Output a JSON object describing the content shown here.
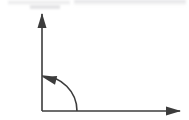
{
  "figure": {
    "kind": "line-art-diagram",
    "background_color": "#ffffff",
    "stroke_color": "#3c3c3c",
    "stroke_width": 1.6,
    "canvas": {
      "width": 189,
      "height": 120
    }
  },
  "geometry": {
    "origin": {
      "x": 42,
      "y": 111
    },
    "y_axis": {
      "name": "vertical-axis",
      "from": {
        "x": 42,
        "y": 111
      },
      "to": {
        "x": 42,
        "y": 14
      },
      "arrow_at": "end",
      "direction": "up"
    },
    "x_axis": {
      "name": "horizontal-axis",
      "from": {
        "x": 42,
        "y": 111
      },
      "to": {
        "x": 180,
        "y": 111
      },
      "arrow_at": "end",
      "direction": "right"
    },
    "arc": {
      "name": "rotation-arc",
      "center": {
        "x": 42,
        "y": 111
      },
      "radius": 35,
      "start_angle_deg": 0,
      "end_angle_deg": 90,
      "sweep": "counterclockwise",
      "start_point": {
        "x": 77,
        "y": 111
      },
      "end_point": {
        "x": 42,
        "y": 76
      },
      "arrow_at": "end",
      "arrow_direction": "left",
      "measure_deg": 90
    },
    "arrowheads": {
      "y_axis_head": {
        "tip": {
          "x": 42,
          "y": 13
        },
        "length": 15,
        "half_width": 4.5
      },
      "x_axis_head": {
        "tip": {
          "x": 181,
          "y": 111
        },
        "length": 15,
        "half_width": 4.5
      },
      "arc_head": {
        "tip": {
          "x": 42.5,
          "y": 77
        },
        "length": 14,
        "half_width": 4.5,
        "angle_deg": 194
      }
    }
  },
  "artifacts": {
    "top_scan_smudge_color": "#e4e4e6"
  }
}
